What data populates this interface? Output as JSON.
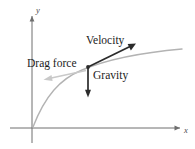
{
  "figure": {
    "background_color": "#ffffff"
  },
  "axes": {
    "y_label": "y",
    "x_label": "x",
    "origin": {
      "x": 32,
      "y": 128
    },
    "x_axis": {
      "start_x": 10,
      "end_x": 182,
      "y": 128
    },
    "y_axis": {
      "x": 32,
      "start_y": 143,
      "end_y": 14
    },
    "color": "#6e6e6e"
  },
  "trajectory": {
    "name": "flight-path-curve",
    "color": "#b3b3b3",
    "start": {
      "x": 33,
      "y": 127
    },
    "end": {
      "x": 182,
      "y": 49
    },
    "shape": "concave-down rising arc"
  },
  "particle": {
    "name": "particle",
    "x": 88,
    "y": 67,
    "color": "#2b2b2b"
  },
  "vectors": [
    {
      "id": "velocity",
      "label": "Velocity",
      "color": "#2b2b2b",
      "from": {
        "x": 88,
        "y": 67
      },
      "to": {
        "x": 135,
        "y": 44
      },
      "direction": "up-right, tangent to trajectory"
    },
    {
      "id": "drag-force",
      "label": "Drag force",
      "color": "#c9c9c9",
      "from": {
        "x": 86,
        "y": 71
      },
      "to": {
        "x": 44,
        "y": 80
      },
      "direction": "down-left, opposite velocity"
    },
    {
      "id": "gravity",
      "label": "Gravity",
      "color": "#2b2b2b",
      "from": {
        "x": 88,
        "y": 67
      },
      "to": {
        "x": 88,
        "y": 97
      },
      "direction": "straight down"
    }
  ]
}
